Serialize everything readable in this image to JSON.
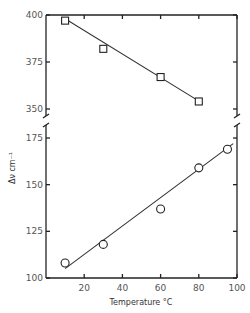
{
  "chart_data": {
    "type": "scatter",
    "title": "",
    "xlabel": "Temperature °C",
    "ylabel": "Δν cm⁻¹",
    "xlim": [
      0,
      100
    ],
    "ylim_upper": [
      350,
      400
    ],
    "ylim_lower": [
      100,
      175
    ],
    "broken_y_axis": true,
    "x_ticks": [
      "20",
      "40",
      "60",
      "80",
      "100"
    ],
    "y_ticks_upper": [
      "400",
      "375",
      "350"
    ],
    "y_ticks_lower": [
      "175",
      "150",
      "125",
      "100"
    ],
    "grid": false,
    "legend": null,
    "series": [
      {
        "name": "upper (squares)",
        "marker": "square",
        "x": [
          10,
          30,
          60,
          80
        ],
        "y": [
          397,
          382,
          367,
          354
        ],
        "fit_line": {
          "x": [
            10,
            82
          ],
          "y": [
            398,
            353
          ]
        }
      },
      {
        "name": "lower (circles)",
        "marker": "circle",
        "x": [
          10,
          30,
          60,
          80,
          95
        ],
        "y": [
          108,
          118,
          137,
          159,
          169
        ],
        "fit_line": {
          "x": [
            10,
            98
          ],
          "y": [
            105,
            172
          ]
        }
      }
    ]
  }
}
